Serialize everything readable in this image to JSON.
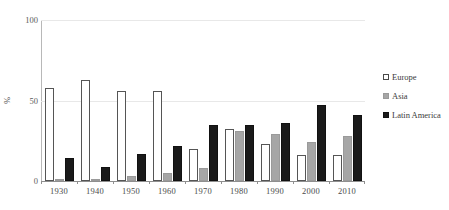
{
  "chart_data": {
    "type": "bar",
    "title": "",
    "xlabel": "",
    "ylabel": "%",
    "ylim": [
      0,
      100
    ],
    "yticks": [
      0,
      50,
      100
    ],
    "grid": true,
    "legend_position": "right",
    "categories": [
      "1930",
      "1940",
      "1950",
      "1960",
      "1970",
      "1980",
      "1990",
      "2000",
      "2010"
    ],
    "series": [
      {
        "name": "Europe",
        "color": "#ffffff",
        "values": [
          58,
          63,
          56,
          56,
          20,
          32,
          23,
          16,
          16
        ]
      },
      {
        "name": "Asia",
        "color": "#a6a6a6",
        "values": [
          1,
          1,
          3,
          5,
          8,
          31,
          29,
          24,
          28
        ]
      },
      {
        "name": "Latin America",
        "color": "#1a1a1a",
        "values": [
          14,
          9,
          17,
          22,
          35,
          35,
          36,
          47,
          41
        ]
      }
    ]
  },
  "legend": {
    "items": [
      {
        "label": "Europe",
        "swatch": "open-square-swatch"
      },
      {
        "label": "Asia",
        "swatch": "gray-square-swatch"
      },
      {
        "label": "Latin America",
        "swatch": "black-square-swatch"
      }
    ]
  },
  "axes": {
    "y_title": "%",
    "y_tick_labels": [
      "100",
      "50",
      "0"
    ],
    "x_tick_labels": [
      "1930",
      "1940",
      "1950",
      "1960",
      "1970",
      "1980",
      "1990",
      "2000",
      "2010"
    ]
  }
}
